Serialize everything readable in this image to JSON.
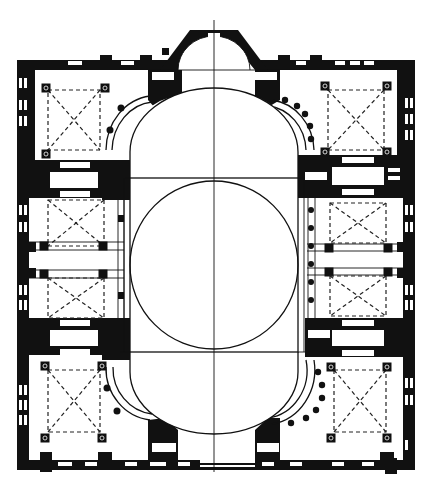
{
  "diagram": {
    "type": "architectural-floor-plan",
    "subject": "Domed church plan with central dome, two half-domes, exedrae and aisle bays",
    "colors": {
      "walls": "#111111",
      "background": "#ffffff",
      "lines": "#111111"
    },
    "elements": {
      "central_dome": "central-dome-circle",
      "half_domes": [
        "north-half-dome",
        "south-half-dome"
      ],
      "apse": "apse",
      "exedrae": [
        "exedra-nw",
        "exedra-ne",
        "exedra-sw",
        "exedra-se"
      ],
      "corner_bays": [
        "bay-nw",
        "bay-ne",
        "bay-sw",
        "bay-se"
      ],
      "side_bays": [
        "bay-w-upper",
        "bay-w-lower",
        "bay-e-upper",
        "bay-e-lower"
      ],
      "axis": "central-axis-line"
    }
  }
}
